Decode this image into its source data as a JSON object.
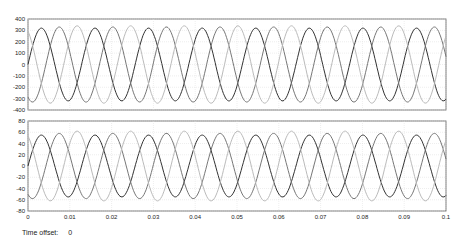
{
  "chart_data": [
    {
      "type": "line",
      "title": "",
      "xlabel": "",
      "ylabel": "",
      "xlim": [
        0,
        0.1
      ],
      "ylim": [
        -400,
        400
      ],
      "yticks": [
        400,
        300,
        200,
        100,
        0,
        -100,
        -200,
        -300,
        -400
      ],
      "grid": true,
      "series": [
        {
          "name": "phase A",
          "color": "#333333",
          "amplitude": 320,
          "phase_deg": 0
        },
        {
          "name": "phase B",
          "color": "#777777",
          "amplitude": 330,
          "phase_deg": 120
        },
        {
          "name": "phase C",
          "color": "#bbbbbb",
          "amplitude": 340,
          "phase_deg": 240
        }
      ],
      "frequency_hz": 78
    },
    {
      "type": "line",
      "title": "",
      "xlabel": "",
      "ylabel": "",
      "xlim": [
        0,
        0.1
      ],
      "ylim": [
        -80,
        80
      ],
      "yticks": [
        80,
        60,
        40,
        20,
        0,
        -20,
        -40,
        -60,
        -80
      ],
      "xticks": [
        "0",
        "0.01",
        "0.02",
        "0.03",
        "0.04",
        "0.05",
        "0.06",
        "0.07",
        "0.08",
        "0.09",
        "0.1"
      ],
      "grid": true,
      "series": [
        {
          "name": "phase A",
          "color": "#333333",
          "amplitude": 55,
          "phase_deg": 0
        },
        {
          "name": "phase B",
          "color": "#777777",
          "amplitude": 58,
          "phase_deg": 120
        },
        {
          "name": "phase C",
          "color": "#bbbbbb",
          "amplitude": 62,
          "phase_deg": 240
        }
      ],
      "frequency_hz": 78
    }
  ],
  "footer": {
    "label": "Time offset:",
    "value": "0"
  }
}
